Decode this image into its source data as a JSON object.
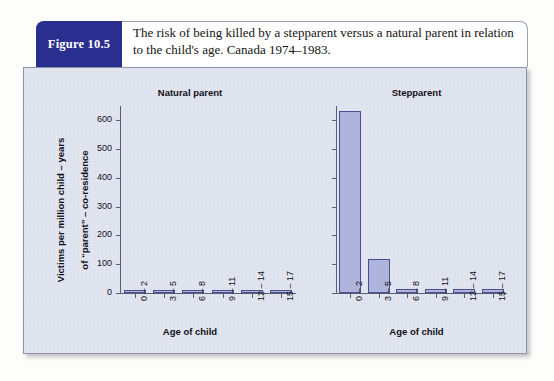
{
  "figure": {
    "tag": "Figure 10.5",
    "caption": "The risk of being killed by a stepparent versus a natural parent in relation to the child's age. Canada 1974–1983."
  },
  "colors": {
    "figure_tag_bg": "#2a2e8e",
    "panel_bg": "#dee2ee",
    "bar_fill": "#aeb4dc",
    "bar_stroke": "#4b4f8e",
    "axis": "#5a5f72"
  },
  "axis_labels": {
    "y_line1": "Victims per million child – years",
    "y_line2": "of “parent” – co-residence",
    "x_left": "Age of child",
    "x_right": "Age of child"
  },
  "chart_data": [
    {
      "type": "bar",
      "title": "Natural parent",
      "categories": [
        "0 – 2",
        "3 – 5",
        "6 – 8",
        "9 – 11",
        "12 – 14",
        "15 – 17"
      ],
      "values": [
        7,
        7,
        7,
        3,
        3,
        3
      ],
      "xlabel": "Age of child",
      "ylabel": "Victims per million child – years of “parent” – co-residence",
      "ylim": [
        0,
        650
      ],
      "yticks": [
        0,
        100,
        200,
        300,
        400,
        500,
        600
      ],
      "ytick_labels": [
        "0",
        "100",
        "200",
        "300",
        "400",
        "500",
        "600"
      ],
      "grid": false,
      "legend": "none"
    },
    {
      "type": "bar",
      "title": "Stepparent",
      "categories": [
        "0 – 2",
        "3 – 5",
        "6 – 8",
        "9 – 11",
        "12 – 14",
        "15 – 17"
      ],
      "values": [
        632,
        119,
        13,
        13,
        13,
        13
      ],
      "xlabel": "Age of child",
      "ylabel": "",
      "ylim": [
        0,
        650
      ],
      "yticks": [
        0,
        100,
        200,
        300,
        400,
        500,
        600
      ],
      "ytick_labels": [
        "",
        "",
        "",
        "",
        "",
        "",
        ""
      ],
      "grid": false,
      "legend": "none"
    }
  ]
}
